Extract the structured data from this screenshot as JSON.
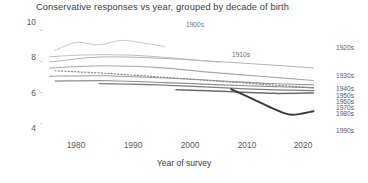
{
  "chart_data": {
    "type": "line",
    "title": "Conservative responses vs year, grouped by decade of birth",
    "xlabel": "Year of survey",
    "ylabel": "",
    "xlim": [
      1972,
      2024
    ],
    "ylim": [
      3.6,
      10.4
    ],
    "xticks": [
      "1980",
      "1990",
      "2000",
      "2010",
      "2020"
    ],
    "xtick_values": [
      1980,
      1990,
      2000,
      2010,
      2020
    ],
    "yticks": [
      "10",
      "8",
      "6",
      "4"
    ],
    "ytick_values": [
      10,
      8,
      6,
      4
    ],
    "grid": false,
    "legend_position": "inline-right",
    "series": [
      {
        "name": "1900s",
        "label": "1900s",
        "label_placement": "inline",
        "color": "#c8c8c8",
        "width": 1.0,
        "style": "solid",
        "x": [
          1974,
          1978,
          1982,
          1986,
          1990,
          1994
        ],
        "values": [
          8.72,
          9.22,
          9.05,
          9.35,
          9.18,
          8.95
        ]
      },
      {
        "name": "1910s",
        "label": "1910s",
        "label_placement": "inline",
        "color": "#c0c0c0",
        "width": 1.0,
        "style": "solid",
        "x": [
          1973,
          1980,
          1988,
          1996,
          2004
        ],
        "values": [
          8.3,
          8.42,
          8.4,
          8.2,
          7.95
        ]
      },
      {
        "name": "1920s",
        "label": "1920s",
        "label_placement": "right",
        "color": "#b4b4b4",
        "width": 1.0,
        "style": "solid",
        "x": [
          1973,
          1982,
          1992,
          2002,
          2012,
          2021
        ],
        "values": [
          7.96,
          8.28,
          8.22,
          8.02,
          7.8,
          7.58
        ]
      },
      {
        "name": "1930s",
        "label": "1930s",
        "label_placement": "right",
        "color": "#a8a8a8",
        "width": 1.1,
        "style": "solid",
        "x": [
          1973,
          1983,
          1993,
          2003,
          2013,
          2021
        ],
        "values": [
          7.58,
          7.72,
          7.6,
          7.28,
          7.0,
          6.78
        ]
      },
      {
        "name": "1940s",
        "label": "1940s",
        "label_placement": "right",
        "color": "#9a9a9a",
        "width": 1.1,
        "style": "solid",
        "x": [
          1973,
          1983,
          1993,
          2003,
          2013,
          2021
        ],
        "values": [
          7.05,
          7.08,
          6.95,
          6.78,
          6.58,
          6.5
        ]
      },
      {
        "name": "1950s",
        "label": "1950s",
        "label_placement": "right",
        "color": "#8e8e8e",
        "width": 1.2,
        "style": "solid",
        "x": [
          1974,
          1984,
          1994,
          2004,
          2014,
          2021
        ],
        "values": [
          6.74,
          6.76,
          6.64,
          6.5,
          6.38,
          6.32
        ]
      },
      {
        "name": "1960s",
        "label": "1960s",
        "label_placement": "right",
        "color": "#7d7d7d",
        "width": 1.3,
        "style": "solid",
        "x": [
          1982,
          1990,
          1998,
          2006,
          2014,
          2021
        ],
        "values": [
          6.58,
          6.52,
          6.42,
          6.28,
          6.18,
          6.12
        ]
      },
      {
        "name": "1970s",
        "label": "1970s",
        "label_placement": "right",
        "color": "#858585",
        "width": 1.2,
        "style": "dotted",
        "x": [
          1974,
          1984,
          1994,
          2004,
          2014,
          2021
        ],
        "values": [
          7.4,
          7.22,
          6.98,
          6.72,
          6.48,
          6.3
        ]
      },
      {
        "name": "1980s",
        "label": "1980s",
        "label_placement": "right",
        "color": "#6a6a6a",
        "width": 1.5,
        "style": "solid",
        "x": [
          1996,
          2002,
          2008,
          2014,
          2021
        ],
        "values": [
          6.18,
          6.12,
          6.02,
          5.95,
          5.98
        ]
      },
      {
        "name": "1990s",
        "label": "1990s",
        "label_placement": "right",
        "color": "#3a3a3a",
        "width": 1.9,
        "style": "solid",
        "x": [
          2006,
          2010,
          2014,
          2017,
          2021
        ],
        "values": [
          6.22,
          5.58,
          4.92,
          4.58,
          4.8
        ]
      }
    ]
  },
  "series_labels": [
    {
      "text": "1900s",
      "left": 186,
      "top": 22
    },
    {
      "text": "1910s",
      "left": 232,
      "top": 52
    },
    {
      "text": "1920s",
      "left": 336,
      "top": 45
    },
    {
      "text": "1930s",
      "left": 336,
      "top": 73
    },
    {
      "text": "1940s",
      "left": 336,
      "top": 86
    },
    {
      "text": "1950s",
      "left": 336,
      "top": 93
    },
    {
      "text": "1960s",
      "left": 336,
      "top": 99
    },
    {
      "text": "1970s",
      "left": 336,
      "top": 105
    },
    {
      "text": "1980s",
      "left": 336,
      "top": 111
    },
    {
      "text": "1990s",
      "left": 336,
      "top": 128
    }
  ],
  "ytick_positions": [
    {
      "label": "10",
      "top": 22
    },
    {
      "label": "8",
      "top": 57
    },
    {
      "label": "6",
      "top": 93
    },
    {
      "label": "4",
      "top": 128
    }
  ],
  "xtick_positions": [
    {
      "label": "1980",
      "left": 76
    },
    {
      "left": 133,
      "label": "1990"
    },
    {
      "label": "2000",
      "left": 190
    },
    {
      "label": "2010",
      "left": 247
    },
    {
      "label": "2020",
      "left": 303
    }
  ]
}
